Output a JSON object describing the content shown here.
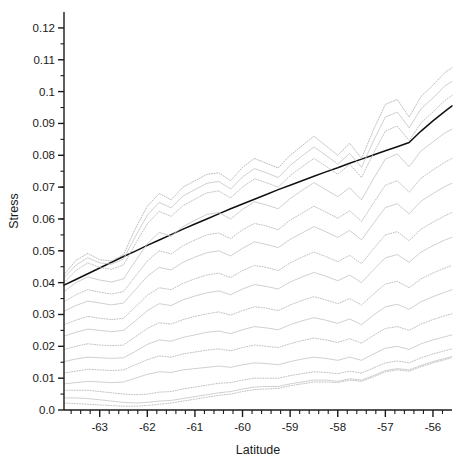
{
  "chart_data": {
    "type": "line",
    "title": "",
    "xlabel": "Latitude",
    "ylabel": "Stress",
    "xlim": [
      -63.75,
      -55.6
    ],
    "ylim": [
      0.0,
      0.125
    ],
    "grid": false,
    "legend_position": "none",
    "xticks": [
      -63,
      -62,
      -61,
      -60,
      -59,
      -58,
      -57,
      -56
    ],
    "xtick_labels": [
      "-63",
      "-62",
      "-61",
      "-60",
      "-59",
      "-58",
      "-57",
      "-56"
    ],
    "x_minor_step": 0.2,
    "yticks": [
      0.0,
      0.01,
      0.02,
      0.03,
      0.04,
      0.05,
      0.06,
      0.07,
      0.08,
      0.09,
      0.1,
      0.11,
      0.12
    ],
    "ytick_labels": [
      "0.0",
      "0.01",
      "0.02",
      "0.03",
      "0.04",
      "0.05",
      "0.06",
      "0.07",
      "0.08",
      "0.09",
      "0.1",
      "0.11",
      "0.12"
    ],
    "y_minor_step": 0.005,
    "colors": {
      "axis": "#1a1a1a",
      "trend": "#111111",
      "quantile_solid": "#b9b9b9",
      "quantile_dotted": "#a8a8a8"
    },
    "x": [
      -63.75,
      -63.5,
      -63.25,
      -63.0,
      -62.75,
      -62.5,
      -62.25,
      -62.0,
      -61.75,
      -61.5,
      -61.25,
      -61.0,
      -60.75,
      -60.5,
      -60.25,
      -60.0,
      -59.75,
      -59.5,
      -59.25,
      -59.0,
      -58.75,
      -58.5,
      -58.25,
      -58.0,
      -57.75,
      -57.5,
      -57.25,
      -57.0,
      -56.75,
      -56.5,
      -56.25,
      -56.0,
      -55.75,
      -55.6
    ],
    "series": [
      {
        "name": "trend",
        "style": "solid",
        "width": 1.5,
        "color": "#111111",
        "values": [
          0.0392,
          0.041,
          0.0428,
          0.0446,
          0.0464,
          0.0482,
          0.0499,
          0.0517,
          0.0534,
          0.0551,
          0.0568,
          0.0584,
          0.06,
          0.0616,
          0.0632,
          0.0647,
          0.0662,
          0.0677,
          0.0692,
          0.0706,
          0.072,
          0.0734,
          0.0748,
          0.0761,
          0.0775,
          0.0788,
          0.0801,
          0.0814,
          0.0827,
          0.084,
          0.0876,
          0.0908,
          0.0938,
          0.0955
        ]
      },
      {
        "name": "quantile-14",
        "style": "dotted",
        "width": 0.8,
        "color": "#a8a8a8",
        "values": [
          0.0425,
          0.047,
          0.0492,
          0.0472,
          0.0468,
          0.0488,
          0.057,
          0.064,
          0.068,
          0.066,
          0.07,
          0.072,
          0.074,
          0.0745,
          0.072,
          0.0762,
          0.079,
          0.0775,
          0.076,
          0.08,
          0.083,
          0.086,
          0.083,
          0.08,
          0.0838,
          0.079,
          0.088,
          0.096,
          0.0975,
          0.092,
          0.0985,
          0.102,
          0.106,
          0.1075
        ]
      },
      {
        "name": "quantile-13",
        "style": "solid",
        "width": 0.8,
        "color": "#c4c4c4",
        "values": [
          0.0415,
          0.0455,
          0.0478,
          0.0462,
          0.0458,
          0.0474,
          0.0545,
          0.0612,
          0.0652,
          0.0635,
          0.0672,
          0.0692,
          0.0712,
          0.0718,
          0.0694,
          0.0732,
          0.0758,
          0.0745,
          0.073,
          0.0768,
          0.0798,
          0.0826,
          0.08,
          0.0772,
          0.0806,
          0.0762,
          0.0845,
          0.092,
          0.0936,
          0.0886,
          0.0946,
          0.098,
          0.1018,
          0.1032
        ]
      },
      {
        "name": "quantile-12",
        "style": "dotted",
        "width": 0.8,
        "color": "#b0b0b0",
        "values": [
          0.04,
          0.0438,
          0.0462,
          0.0448,
          0.0442,
          0.0456,
          0.0522,
          0.0585,
          0.0624,
          0.0608,
          0.0642,
          0.0662,
          0.0682,
          0.0688,
          0.0666,
          0.07,
          0.0726,
          0.0714,
          0.07,
          0.0736,
          0.0764,
          0.079,
          0.0766,
          0.074,
          0.0772,
          0.073,
          0.0806,
          0.0876,
          0.0892,
          0.0846,
          0.0902,
          0.0936,
          0.0972,
          0.0988
        ]
      },
      {
        "name": "quantile-11",
        "style": "solid",
        "width": 0.8,
        "color": "#c4c4c4",
        "values": [
          0.0372,
          0.04,
          0.0418,
          0.0408,
          0.0402,
          0.0412,
          0.0468,
          0.0522,
          0.0558,
          0.0546,
          0.0576,
          0.0596,
          0.0614,
          0.062,
          0.06,
          0.063,
          0.0654,
          0.0644,
          0.0632,
          0.0664,
          0.069,
          0.0714,
          0.0692,
          0.067,
          0.0698,
          0.066,
          0.0726,
          0.0788,
          0.0804,
          0.0764,
          0.0814,
          0.0842,
          0.087,
          0.0882
        ]
      },
      {
        "name": "quantile-10",
        "style": "dotted",
        "width": 0.8,
        "color": "#b0b0b0",
        "values": [
          0.034,
          0.0362,
          0.0378,
          0.037,
          0.0364,
          0.0372,
          0.042,
          0.0468,
          0.05,
          0.049,
          0.0516,
          0.0534,
          0.055,
          0.0556,
          0.0538,
          0.0566,
          0.0586,
          0.0578,
          0.0566,
          0.0596,
          0.0618,
          0.064,
          0.0622,
          0.0602,
          0.0626,
          0.0592,
          0.065,
          0.0706,
          0.072,
          0.0684,
          0.0728,
          0.0754,
          0.0778,
          0.079
        ]
      },
      {
        "name": "quantile-9",
        "style": "solid",
        "width": 0.8,
        "color": "#c4c4c4",
        "values": [
          0.031,
          0.0328,
          0.0342,
          0.0336,
          0.033,
          0.0336,
          0.0378,
          0.042,
          0.0448,
          0.044,
          0.0464,
          0.048,
          0.0494,
          0.05,
          0.0484,
          0.0508,
          0.0528,
          0.052,
          0.051,
          0.0536,
          0.0556,
          0.0576,
          0.056,
          0.0542,
          0.0564,
          0.0534,
          0.0586,
          0.0636,
          0.0648,
          0.0616,
          0.0656,
          0.068,
          0.0702,
          0.0712
        ]
      },
      {
        "name": "quantile-8",
        "style": "dotted",
        "width": 0.8,
        "color": "#b0b0b0",
        "values": [
          0.0268,
          0.0282,
          0.0294,
          0.0288,
          0.0284,
          0.0288,
          0.0324,
          0.036,
          0.0384,
          0.0378,
          0.0398,
          0.0412,
          0.0424,
          0.043,
          0.0416,
          0.0438,
          0.0454,
          0.0448,
          0.0438,
          0.0462,
          0.048,
          0.0496,
          0.0482,
          0.0466,
          0.0486,
          0.046,
          0.0506,
          0.055,
          0.056,
          0.0532,
          0.0568,
          0.059,
          0.061,
          0.062
        ]
      },
      {
        "name": "quantile-7",
        "style": "solid",
        "width": 0.8,
        "color": "#c4c4c4",
        "values": [
          0.0232,
          0.0244,
          0.0254,
          0.025,
          0.0246,
          0.025,
          0.028,
          0.0312,
          0.0334,
          0.0328,
          0.0346,
          0.0358,
          0.0368,
          0.0374,
          0.0362,
          0.038,
          0.0394,
          0.0388,
          0.038,
          0.0402,
          0.0418,
          0.0432,
          0.042,
          0.0406,
          0.0424,
          0.04,
          0.044,
          0.0478,
          0.0488,
          0.0464,
          0.0496,
          0.0516,
          0.0534,
          0.0542
        ]
      },
      {
        "name": "quantile-6",
        "style": "dotted",
        "width": 0.8,
        "color": "#b0b0b0",
        "values": [
          0.019,
          0.02,
          0.0208,
          0.0204,
          0.0202,
          0.0204,
          0.023,
          0.0256,
          0.0274,
          0.027,
          0.0284,
          0.0294,
          0.0302,
          0.0308,
          0.0298,
          0.0312,
          0.0324,
          0.032,
          0.0312,
          0.033,
          0.0344,
          0.0356,
          0.0346,
          0.0334,
          0.035,
          0.033,
          0.0364,
          0.0396,
          0.0404,
          0.0384,
          0.0412,
          0.043,
          0.0446,
          0.0454
        ]
      },
      {
        "name": "quantile-5",
        "style": "solid",
        "width": 0.8,
        "color": "#c4c4c4",
        "values": [
          0.0152,
          0.016,
          0.0166,
          0.0164,
          0.0162,
          0.0164,
          0.0184,
          0.0206,
          0.022,
          0.0216,
          0.0228,
          0.0236,
          0.0244,
          0.0248,
          0.024,
          0.0252,
          0.0262,
          0.0258,
          0.0252,
          0.0268,
          0.028,
          0.029,
          0.0282,
          0.0272,
          0.0286,
          0.0268,
          0.0298,
          0.0324,
          0.0332,
          0.0316,
          0.034,
          0.0356,
          0.037,
          0.0378
        ]
      },
      {
        "name": "quantile-4",
        "style": "dotted",
        "width": 0.8,
        "color": "#b0b0b0",
        "values": [
          0.0116,
          0.0122,
          0.0128,
          0.0126,
          0.0124,
          0.0126,
          0.0142,
          0.0158,
          0.017,
          0.0166,
          0.0176,
          0.0182,
          0.0188,
          0.0192,
          0.0186,
          0.0196,
          0.0204,
          0.02,
          0.0196,
          0.0208,
          0.0218,
          0.0226,
          0.022,
          0.0212,
          0.0224,
          0.021,
          0.0234,
          0.0256,
          0.0262,
          0.025,
          0.027,
          0.0284,
          0.0296,
          0.0302
        ]
      },
      {
        "name": "quantile-3",
        "style": "solid",
        "width": 0.8,
        "color": "#c4c4c4",
        "values": [
          0.0082,
          0.0086,
          0.009,
          0.0088,
          0.0086,
          0.0088,
          0.01,
          0.0112,
          0.012,
          0.0118,
          0.0126,
          0.013,
          0.0134,
          0.0138,
          0.0134,
          0.0142,
          0.0148,
          0.0146,
          0.0142,
          0.0152,
          0.016,
          0.0166,
          0.0162,
          0.0156,
          0.0166,
          0.0156,
          0.0176,
          0.0194,
          0.02,
          0.019,
          0.0208,
          0.022,
          0.023,
          0.0236
        ]
      },
      {
        "name": "quantile-2",
        "style": "dotted",
        "width": 0.8,
        "color": "#b0b0b0",
        "values": [
          0.0062,
          0.0062,
          0.0062,
          0.0058,
          0.0054,
          0.005,
          0.0048,
          0.005,
          0.0056,
          0.0058,
          0.0066,
          0.0072,
          0.0078,
          0.0084,
          0.0086,
          0.0094,
          0.01,
          0.01,
          0.01,
          0.0108,
          0.0114,
          0.012,
          0.0118,
          0.0114,
          0.0122,
          0.0116,
          0.0132,
          0.0148,
          0.0154,
          0.0148,
          0.0164,
          0.0176,
          0.0186,
          0.0192
        ]
      },
      {
        "name": "quantile-1",
        "style": "solid",
        "width": 0.8,
        "color": "#c4c4c4",
        "values": [
          0.0038,
          0.0038,
          0.0036,
          0.0032,
          0.0028,
          0.0024,
          0.0022,
          0.0024,
          0.0028,
          0.003,
          0.0036,
          0.0042,
          0.0048,
          0.0054,
          0.0058,
          0.0066,
          0.0072,
          0.0074,
          0.0074,
          0.0082,
          0.0088,
          0.0094,
          0.0094,
          0.009,
          0.0098,
          0.0094,
          0.0108,
          0.0124,
          0.013,
          0.0126,
          0.014,
          0.0152,
          0.0162,
          0.0168
        ]
      },
      {
        "name": "quantile-0",
        "style": "dotted",
        "width": 0.8,
        "color": "#b0b0b0",
        "values": [
          0.0022,
          0.002,
          0.0018,
          0.0016,
          0.0014,
          0.0012,
          0.0012,
          0.0014,
          0.0018,
          0.0022,
          0.0028,
          0.0034,
          0.004,
          0.0046,
          0.005,
          0.0058,
          0.0064,
          0.0066,
          0.0068,
          0.0076,
          0.0082,
          0.0088,
          0.0088,
          0.0086,
          0.0094,
          0.009,
          0.0104,
          0.012,
          0.0126,
          0.0122,
          0.0136,
          0.0148,
          0.0158,
          0.0164
        ]
      }
    ]
  }
}
